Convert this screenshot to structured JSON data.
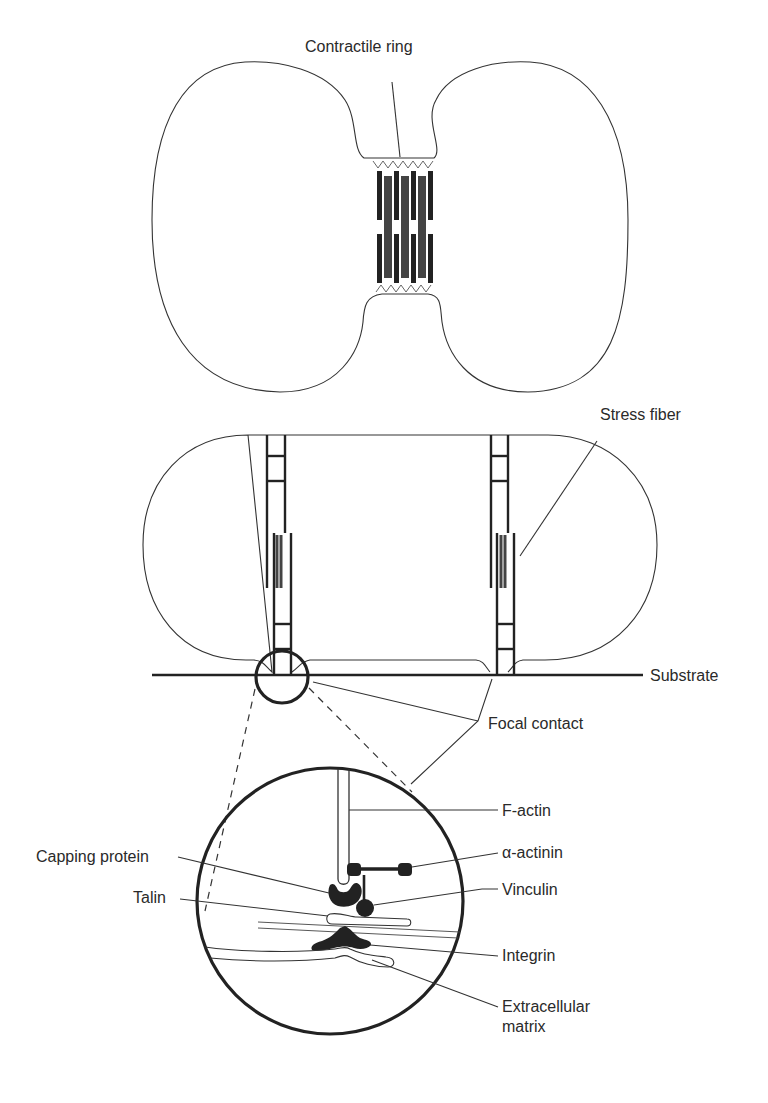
{
  "diagram": {
    "panels": [
      {
        "id": "dividing-cell",
        "description": "Cell undergoing cytokinesis with contractile ring of actin-myosin filaments at the cleavage furrow",
        "labels": {
          "contractile_ring": "Contractile ring"
        }
      },
      {
        "id": "adherent-cell",
        "description": "Cell attached to substrate with stress fibers ending in focal contacts",
        "labels": {
          "stress_fiber": "Stress fiber",
          "substrate": "Substrate",
          "focal_contact": "Focal contact"
        }
      },
      {
        "id": "focal-contact-detail",
        "description": "Magnified view of a focal contact showing molecular components",
        "labels": {
          "f_actin": "F-actin",
          "alpha_actinin": "α-actinin",
          "capping_protein": "Capping protein",
          "vinculin": "Vinculin",
          "talin": "Talin",
          "integrin": "Integrin",
          "extracellular_matrix_line1": "Extracellular",
          "extracellular_matrix_line2": "matrix"
        }
      }
    ],
    "colors": {
      "line": "#333333",
      "filament_dark": "#222222",
      "filament_gray": "#444444",
      "background": "#ffffff"
    }
  }
}
